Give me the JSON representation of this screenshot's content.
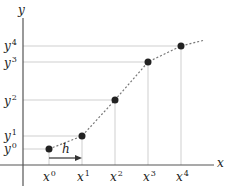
{
  "diagram": {
    "axes": {
      "x_label": "x",
      "y_label": "y"
    },
    "step_label": "h",
    "points": [
      {
        "x_label": "x",
        "x_sup": "0",
        "y_label": "y",
        "y_sup": "0"
      },
      {
        "x_label": "x",
        "x_sup": "1",
        "y_label": "y",
        "y_sup": "1"
      },
      {
        "x_label": "x",
        "x_sup": "2",
        "y_label": "y",
        "y_sup": "2"
      },
      {
        "x_label": "x",
        "x_sup": "3",
        "y_label": "y",
        "y_sup": "3"
      },
      {
        "x_label": "x",
        "x_sup": "4",
        "y_label": "y",
        "y_sup": "4"
      }
    ],
    "colors": {
      "axis": "#555555",
      "grid": "#cccccc",
      "curve": "#777777",
      "point": "#222222"
    }
  }
}
